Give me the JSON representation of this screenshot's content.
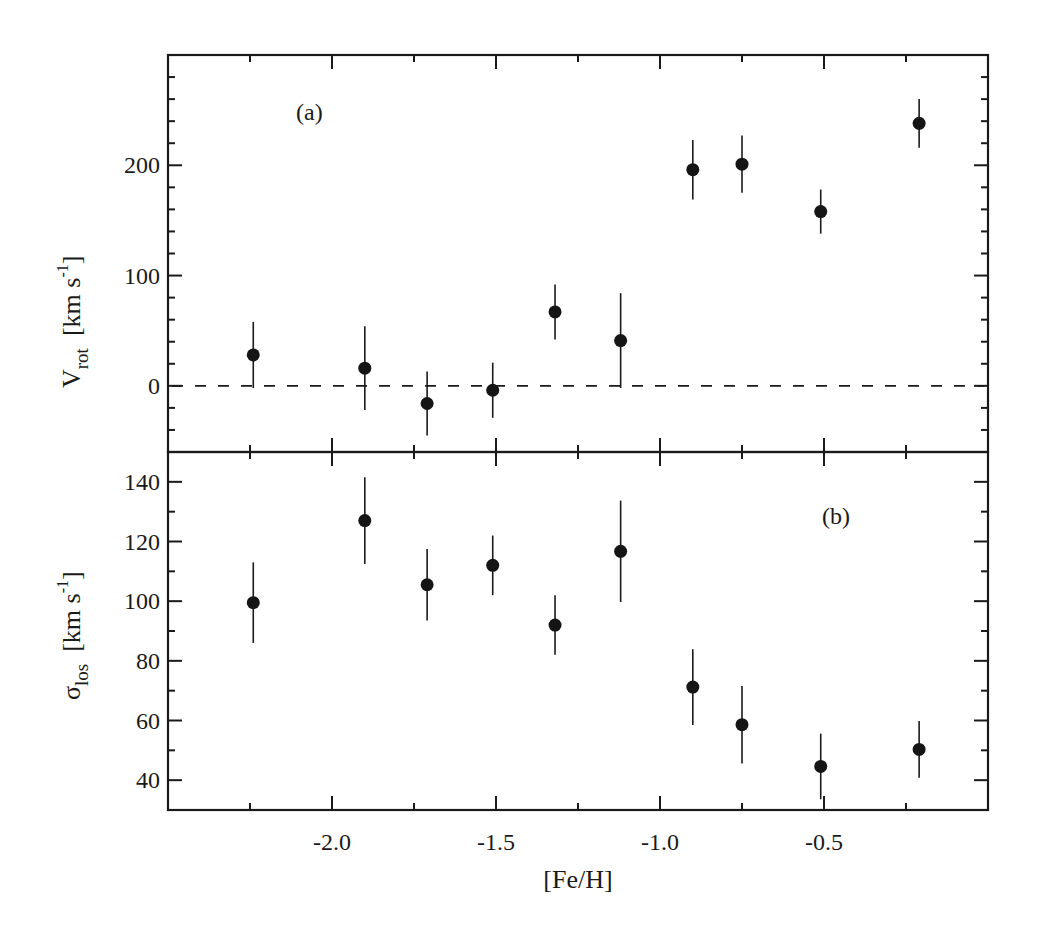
{
  "chart_data": [
    {
      "type": "scatter",
      "panel_label": "(a)",
      "ylabel_main": "V",
      "ylabel_sub": "rot",
      "ylabel_unit": "[km s",
      "ylabel_unit_sup": "-1",
      "ylabel_unit_end": "]",
      "xlabel": "",
      "xlim": [
        -2.5,
        0.0
      ],
      "ylim": [
        -60,
        300
      ],
      "yticks_major": [
        0,
        100,
        200
      ],
      "ytick_labels": [
        "0",
        "100",
        "200"
      ],
      "yticks_minor_step": 20,
      "reference_line": {
        "y": 0,
        "style": "dashed"
      },
      "grid": false,
      "series": [
        {
          "name": "V_rot",
          "marker": "filled-circle",
          "x": [
            -2.24,
            -1.9,
            -1.71,
            -1.51,
            -1.32,
            -1.12,
            -0.9,
            -0.75,
            -0.51,
            -0.21
          ],
          "y": [
            28,
            16,
            -16,
            -4,
            67,
            41,
            196,
            201,
            158,
            238
          ],
          "yerr": [
            30,
            38,
            29,
            25,
            25,
            43,
            27,
            26,
            20,
            22
          ]
        }
      ]
    },
    {
      "type": "scatter",
      "panel_label": "(b)",
      "ylabel_main": "σ",
      "ylabel_sub": "los",
      "ylabel_unit": "[km s",
      "ylabel_unit_sup": "-1",
      "ylabel_unit_end": "]",
      "xlabel": "[Fe/H]",
      "xlim": [
        -2.5,
        0.0
      ],
      "ylim": [
        30,
        150
      ],
      "xticks": [
        -2.0,
        -1.5,
        -1.0,
        -0.5
      ],
      "xtick_labels": [
        "-2.0",
        "-1.5",
        "-1.0",
        "-0.5"
      ],
      "xticks_minor_step": 0.25,
      "yticks_major": [
        40,
        60,
        80,
        100,
        120,
        140
      ],
      "ytick_labels": [
        "40",
        "60",
        "80",
        "100",
        "120",
        "140"
      ],
      "yticks_minor_step": 10,
      "grid": false,
      "series": [
        {
          "name": "sigma_los",
          "marker": "filled-circle",
          "x": [
            -2.24,
            -1.9,
            -1.71,
            -1.51,
            -1.32,
            -1.12,
            -0.9,
            -0.75,
            -0.51,
            -0.21
          ],
          "y": [
            99.5,
            127,
            105.5,
            112,
            92,
            116.7,
            71.2,
            58.6,
            44.6,
            50.3
          ],
          "yerr": [
            13.5,
            14.5,
            12,
            10,
            10,
            17,
            12.7,
            13,
            11,
            9.5
          ]
        }
      ]
    }
  ]
}
